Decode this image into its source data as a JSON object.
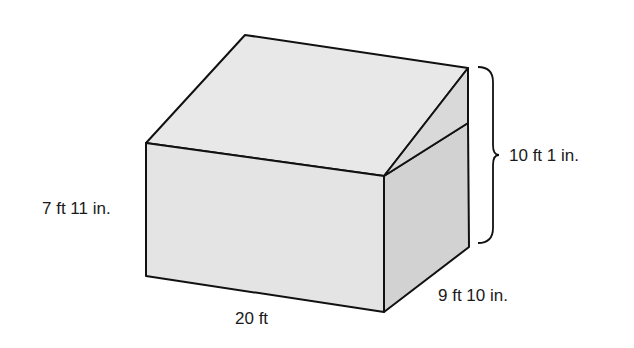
{
  "figure": {
    "type": "3D solid: rectangular prism with sloped (wedge) roof",
    "labels": {
      "front_height": "7 ft 11 in.",
      "total_height": "10 ft 1 in.",
      "depth": "9 ft 10 in.",
      "length": "20 ft"
    },
    "colors": {
      "top_face": "#e8e8e8",
      "front_face": "#e4e4e4",
      "side_face": "#d2d2d2",
      "wedge_face": "#d9d9d9",
      "outline": "#111111"
    }
  }
}
